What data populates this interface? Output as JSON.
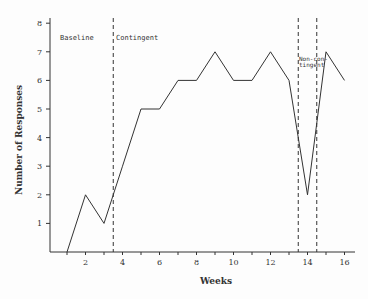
{
  "chart_data": {
    "type": "line",
    "title": "",
    "xlabel": "Weeks",
    "ylabel": "Number of Responses",
    "x": [
      1,
      2,
      3,
      4,
      5,
      6,
      7,
      8,
      9,
      10,
      11,
      12,
      13,
      14,
      15,
      16
    ],
    "series": [
      {
        "name": "Responses",
        "values": [
          0,
          2,
          1,
          3,
          5,
          5,
          6,
          6,
          7,
          6,
          6,
          7,
          6,
          2,
          7,
          6
        ]
      }
    ],
    "xticks": [
      2,
      4,
      6,
      8,
      10,
      12,
      14,
      16
    ],
    "yticks": [
      1,
      2,
      3,
      4,
      5,
      6,
      7,
      8
    ],
    "xlim": [
      0,
      16.5
    ],
    "ylim": [
      0,
      8
    ],
    "grid": false,
    "legend": null,
    "phase_lines": [
      3.5,
      13.5,
      14.5
    ],
    "annotations": [
      {
        "text": "Baseline",
        "x": 1.2,
        "y": 7.5
      },
      {
        "text": "Contingent",
        "x": 3.8,
        "y": 7.5
      },
      {
        "text": "Non-con-",
        "x": 13.55,
        "y": 6.95
      },
      {
        "text": "tingent",
        "x": 13.55,
        "y": 6.7
      }
    ]
  },
  "labels": {
    "xlabel": "Weeks",
    "ylabel": "Number of Responses",
    "baseline": "Baseline",
    "contingent": "Contingent",
    "noncontingent_1": "Non-con-",
    "noncontingent_2": "tingent"
  }
}
